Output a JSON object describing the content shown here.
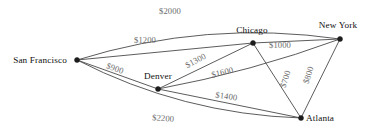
{
  "figure": {
    "name": "airline-route-cost-graph",
    "background": "#ffffff",
    "width": 373,
    "height": 133
  },
  "style": {
    "edge_color": "#4a4a4a",
    "node_color": "#1c1c1c",
    "node_label_color": "#101010",
    "edge_label_color": "#6b6b6b"
  },
  "chart_data": {
    "type": "diagram",
    "title": "",
    "graph_kind": "undirected weighted graph",
    "nodes": [
      {
        "id": "san_francisco",
        "label": "San Francisco",
        "x": 77,
        "y": 60,
        "label_x": 40,
        "label_y": 63,
        "label_anchor": "middle"
      },
      {
        "id": "denver",
        "label": "Denver",
        "x": 158,
        "y": 89,
        "label_x": 158,
        "label_y": 79,
        "label_anchor": "middle"
      },
      {
        "id": "chicago",
        "label": "Chicago",
        "x": 253,
        "y": 43,
        "label_x": 252,
        "label_y": 33,
        "label_anchor": "middle"
      },
      {
        "id": "new_york",
        "label": "New York",
        "x": 340,
        "y": 39,
        "label_x": 338,
        "label_y": 28,
        "label_anchor": "middle"
      },
      {
        "id": "atlanta",
        "label": "Atlanta",
        "x": 301,
        "y": 118,
        "label_x": 306,
        "label_y": 121,
        "label_anchor": "start"
      }
    ],
    "edges": [
      {
        "id": "sf_ny",
        "from": "san_francisco",
        "to": "new_york",
        "weight": 2000,
        "label": "$2000",
        "label_x": 170,
        "label_y": 14,
        "rotation": 0,
        "curve": -30
      },
      {
        "id": "sf_chicago",
        "from": "san_francisco",
        "to": "chicago",
        "weight": 1200,
        "label": "$1200",
        "label_x": 145,
        "label_y": 43,
        "rotation": 0,
        "curve": 0
      },
      {
        "id": "sf_denver",
        "from": "san_francisco",
        "to": "denver",
        "weight": 900,
        "label": "$900",
        "label_x": 114,
        "label_y": 71,
        "rotation": 20,
        "curve": 0
      },
      {
        "id": "sf_atlanta",
        "from": "san_francisco",
        "to": "atlanta",
        "weight": 2200,
        "label": "$2200",
        "label_x": 163,
        "label_y": 121,
        "rotation": 4,
        "curve": 26
      },
      {
        "id": "denver_chicago",
        "from": "denver",
        "to": "chicago",
        "weight": 1300,
        "label": "$1300",
        "label_x": 197,
        "label_y": 63,
        "rotation": -28,
        "curve": 0
      },
      {
        "id": "denver_ny",
        "from": "denver",
        "to": "new_york",
        "weight": 1600,
        "label": "$1600",
        "label_x": 223,
        "label_y": 75,
        "rotation": -14,
        "curve": 8
      },
      {
        "id": "denver_atlanta",
        "from": "denver",
        "to": "atlanta",
        "weight": 1400,
        "label": "$1400",
        "label_x": 226,
        "label_y": 99,
        "rotation": 8,
        "curve": 0
      },
      {
        "id": "chicago_ny",
        "from": "chicago",
        "to": "new_york",
        "weight": 1000,
        "label": "$1000",
        "label_x": 280,
        "label_y": 48,
        "rotation": 0,
        "curve": 0
      },
      {
        "id": "chicago_atlanta",
        "from": "chicago",
        "to": "atlanta",
        "weight": 700,
        "label": "$700",
        "label_x": 288,
        "label_y": 80,
        "rotation": -72,
        "curve": 0
      },
      {
        "id": "ny_atlanta",
        "from": "new_york",
        "to": "atlanta",
        "weight": 800,
        "label": "$800",
        "label_x": 311,
        "label_y": 76,
        "rotation": -72,
        "curve": 0
      }
    ],
    "xlabel": "",
    "ylabel": "",
    "legend": []
  }
}
